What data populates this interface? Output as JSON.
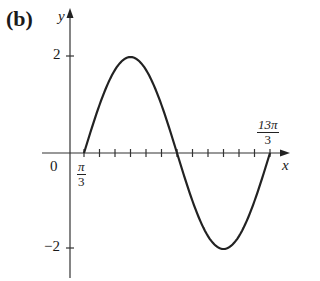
{
  "panel": {
    "label": "(b)"
  },
  "axes": {
    "x_label": "x",
    "y_label": "y",
    "origin_label": "0",
    "y_ticks": [
      {
        "value": 2,
        "label": "2"
      },
      {
        "value": -2,
        "label": "−2"
      }
    ],
    "x_tick_labels": [
      {
        "num": "π",
        "den": "3"
      },
      {
        "num": "13π",
        "den": "3"
      }
    ]
  },
  "chart_data": {
    "type": "line",
    "title": "(b)",
    "xlabel": "x",
    "ylabel": "y",
    "function": "y = 2 sin((x - π/3)/2)",
    "xlim": [
      0,
      4.6
    ],
    "x_units": "π",
    "ylim": [
      -2.5,
      2.5
    ],
    "x_ticks_pi_over_3": [
      1,
      2,
      3,
      4,
      5,
      6,
      7,
      8,
      9,
      10,
      11,
      12,
      13
    ],
    "labeled_x_ticks": [
      "π/3",
      "13π/3"
    ],
    "labeled_y_ticks": [
      2,
      -2
    ],
    "series": [
      {
        "name": "curve",
        "x": [
          "π/3",
          "4π/3",
          "7π/3",
          "10π/3",
          "13π/3"
        ],
        "values": [
          0,
          2,
          0,
          -2,
          0
        ]
      }
    ],
    "grid": false,
    "legend": null
  }
}
